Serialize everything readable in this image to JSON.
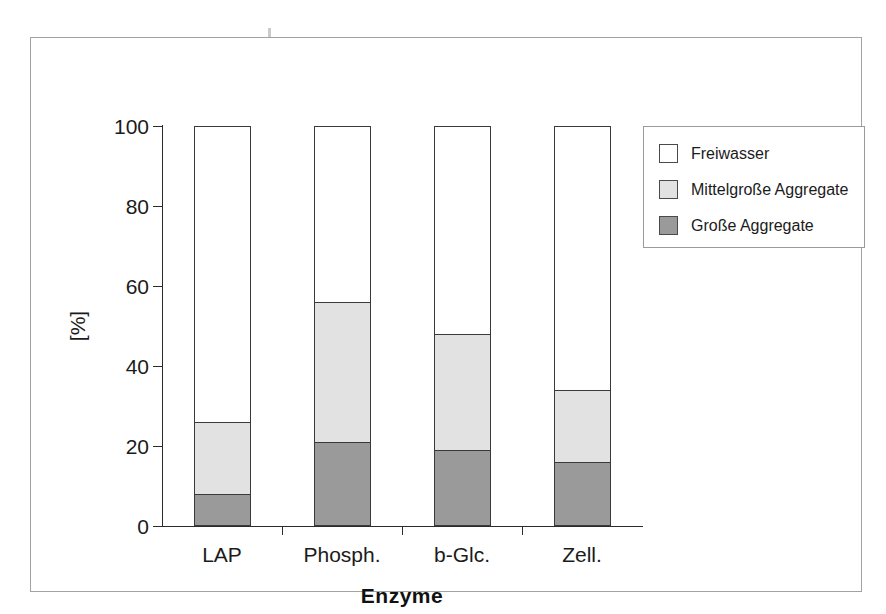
{
  "figure": {
    "background_color": "#ffffff",
    "frame_color": "#9fa3a5"
  },
  "chart_data": {
    "type": "bar",
    "subtype": "stacked-bar-100",
    "title": "",
    "xlabel": "Enzyme",
    "ylabel": "[%]",
    "ylim": [
      0,
      100
    ],
    "yticks": [
      0,
      20,
      40,
      60,
      80,
      100
    ],
    "ytick_labels": [
      "0",
      "20",
      "40",
      "60",
      "80",
      "100"
    ],
    "grid": false,
    "legend_position": "upper right outside",
    "categories": [
      "LAP",
      "Phosph.",
      "b-Glc.",
      "Zell."
    ],
    "series": [
      {
        "name": "Große Aggregate",
        "color": "#9a9a9a",
        "values": [
          8,
          21,
          19,
          16
        ]
      },
      {
        "name": "Mittelgroße Aggregate",
        "color": "#e2e2e2",
        "values": [
          18,
          35,
          29,
          18
        ],
        "cumulative_tops": [
          26,
          56,
          48,
          34
        ]
      },
      {
        "name": "Freiwasser",
        "color": "#ffffff",
        "values": [
          74,
          44,
          52,
          66
        ],
        "cumulative_tops": [
          100,
          100,
          100,
          100
        ]
      }
    ]
  },
  "legend": {
    "items": [
      {
        "label": "Freiwasser",
        "color": "#ffffff"
      },
      {
        "label": "Mittelgroße Aggregate",
        "color": "#e2e2e2"
      },
      {
        "label": "Große Aggregate",
        "color": "#9a9a9a"
      }
    ]
  }
}
